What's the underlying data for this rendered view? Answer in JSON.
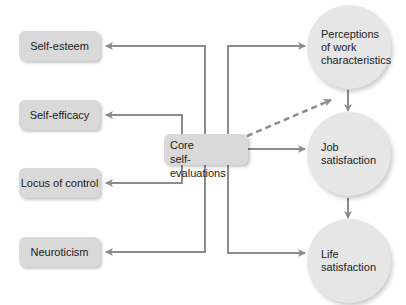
{
  "diagram": {
    "center": {
      "line1": "Core",
      "line2": "self-evaluations"
    },
    "traits": [
      {
        "label": "Self-esteem"
      },
      {
        "label": "Self-efficacy"
      },
      {
        "label": "Locus of control"
      },
      {
        "label": "Neuroticism"
      }
    ],
    "outcomes": [
      {
        "line1": "Perceptions",
        "line2": "of work",
        "line3": "characteristics"
      },
      {
        "line1": "Job",
        "line2": "satisfaction"
      },
      {
        "line1": "Life",
        "line2": "satisfaction"
      }
    ],
    "colors": {
      "box": "#d9d9d9",
      "circle": "#e6e6e6",
      "arrow": "#8c8c8c"
    },
    "edges": [
      {
        "from": "Core self-evaluations",
        "to": "Self-esteem",
        "style": "solid"
      },
      {
        "from": "Core self-evaluations",
        "to": "Self-efficacy",
        "style": "solid"
      },
      {
        "from": "Core self-evaluations",
        "to": "Locus of control",
        "style": "solid"
      },
      {
        "from": "Core self-evaluations",
        "to": "Neuroticism",
        "style": "solid"
      },
      {
        "from": "Core self-evaluations",
        "to": "Perceptions of work characteristics",
        "style": "solid"
      },
      {
        "from": "Core self-evaluations",
        "to": "Job satisfaction",
        "style": "solid"
      },
      {
        "from": "Core self-evaluations",
        "to": "Life satisfaction",
        "style": "solid"
      },
      {
        "from": "Core self-evaluations",
        "to": "Perceptions of work characteristics / Job satisfaction",
        "style": "dashed"
      },
      {
        "from": "Perceptions of work characteristics",
        "to": "Job satisfaction",
        "style": "solid"
      },
      {
        "from": "Job satisfaction",
        "to": "Life satisfaction",
        "style": "solid"
      }
    ]
  }
}
